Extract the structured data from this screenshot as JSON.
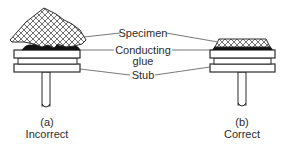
{
  "diagram": {
    "labels": {
      "specimen": "Specimen",
      "conducting": "Conducting",
      "glue": "glue",
      "stub": "Stub"
    },
    "panels": [
      {
        "id": "a",
        "letter": "(a)",
        "caption": "Incorrect"
      },
      {
        "id": "b",
        "letter": "(b)",
        "caption": "Correct"
      }
    ],
    "colors": {
      "line": "#2b2b2b",
      "glue": "#111111",
      "background": "#ffffff"
    }
  }
}
